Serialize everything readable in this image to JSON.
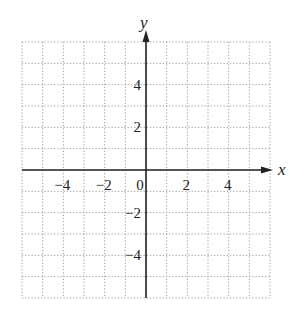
{
  "chart_data": {
    "type": "coordinate-grid",
    "title": "",
    "xlabel": "x",
    "ylabel": "y",
    "xlim": [
      -6,
      6
    ],
    "ylim": [
      -6,
      6
    ],
    "grid": true,
    "grid_style": "dotted",
    "grid_step": 1,
    "x_ticks": [
      {
        "value": -4,
        "label": "−4"
      },
      {
        "value": -2,
        "label": "−2"
      },
      {
        "value": 0,
        "label": "0"
      },
      {
        "value": 2,
        "label": "2"
      },
      {
        "value": 4,
        "label": "4"
      }
    ],
    "y_ticks": [
      {
        "value": 4,
        "label": "4"
      },
      {
        "value": 2,
        "label": "2"
      },
      {
        "value": -2,
        "label": "−2"
      },
      {
        "value": -4,
        "label": "−4"
      }
    ],
    "series": []
  },
  "colors": {
    "axis": "#222222",
    "grid": "#9a9a9a",
    "background": "#ffffff"
  }
}
